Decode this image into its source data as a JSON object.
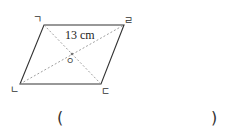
{
  "diagram": {
    "type": "parallelogram-diagonals",
    "vertices": {
      "top_left": "ㄱ",
      "top_right": "ㄹ",
      "bottom_left": "ㄴ",
      "bottom_right": "ㄷ"
    },
    "center": "ㅇ",
    "measurement": "13 cm",
    "answer_blank": {
      "open": "(",
      "close": ")"
    },
    "colors": {
      "stroke": "#333333",
      "dashed": "#888888"
    }
  }
}
